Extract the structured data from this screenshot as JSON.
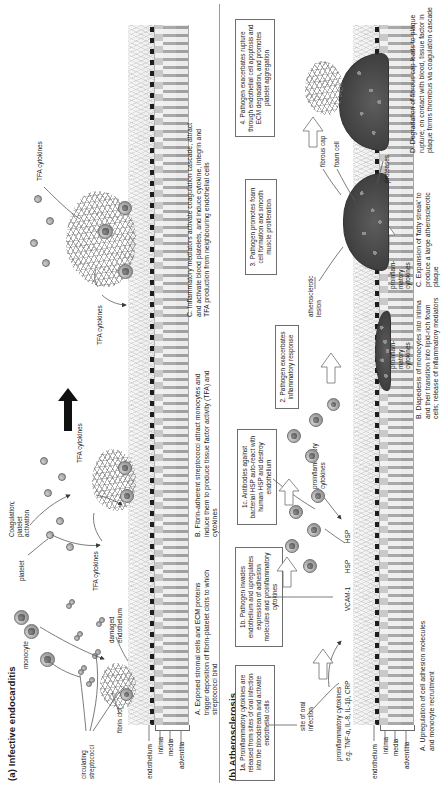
{
  "figure": {
    "panels": [
      {
        "id": "a",
        "title": "(a) Infective endocarditis",
        "labels": {
          "circulating_streptococci": "circulating\nstreptococci",
          "monocyte": "monocyte",
          "fibrin_clot": "fibrin clot",
          "damaged_endothelium": "damaged\nendothelium",
          "platelet": "platelet",
          "coagulation": "Coagulation;\nplatelet\nactivation",
          "tfa_cytokines_1": "TFA cytokines",
          "tfa_cytokines_2": "TFA cytokines",
          "tfa_cytokines_3": "TFA cytokines",
          "tfa_cytokines_4": "TFA cytokines",
          "wall_endothelium": "endothelium",
          "wall_intima": "intima",
          "wall_media": "media",
          "wall_adventitia": "adventitia"
        },
        "captions": [
          "A. Exposed stromal cells and ECM proteins trigger deposition of fibrin-platelet clots to which streptococci bind",
          "B. Fibrin-adherent streptococci attract monocytes and induce them to produce tissue factor activity (TFA) and cytokines",
          "C. Inflammatory mediators activate coagulation cascade, attract and activate blood platelets, and induce cytokine, integrin and TFA production from neighbouring endothelial cells"
        ]
      },
      {
        "id": "b",
        "title": "(b) Atherosclerosis",
        "labels": {
          "site_of_oral_infection": "site of oral\ninfection",
          "proinflammatory_cytokines": "proinflammatory cytokines",
          "cytokine_examples": "e.g. TNF-α, IL-8, IL-1β, CRP",
          "vcam1": "VCAM-1",
          "hsp_1": "HSP",
          "hsp_2": "HSP",
          "proinflammatory_cytokines_2": "proinflammatory\ncytokines",
          "proinflammatory_cytokines_3": "proinflam-\nmatory\ncytokines",
          "proinflammatory_cytokines_4": "proinflam-\nmatory\ncytokines",
          "atherosclerotic_lesion": "atherosclerotic\nlesion",
          "fibrous_cap": "fibrous cap",
          "foam_cell": "foam cell",
          "proteases": "proteases",
          "wall_endothelium": "endothelium",
          "wall_intima": "intima",
          "wall_media": "media",
          "wall_adventitia": "adventitia"
        },
        "boxes": [
          "1a. Proinflammatory cytokines are released from sites of oral infection into the bloodstream and activate endothelial cells",
          "1b. Pathogen invades endothelium and upregulates expression of adhesion molecules and proinflammatory cytokines",
          "1c. Antibodies against bacterial HSP auto-react with human HSP and destroy endothelium",
          "2. Pathogen exacerbates inflammatory response",
          "3. Pathogen promotes foam cell formation and smooth muscle proliferation",
          "4. Pathogen exacerbates rupture through endothelial cell apoptosis and ECM degradation, and promotes platelet aggregation"
        ],
        "captions": [
          "A. Upregulation of cell adhesion molecules and monocyte recruitment",
          "B. Diapedesis of monocytes into intima and their transition into lipid-rich foam cells; release of inflammatory mediators",
          "C. Expansion of 'fatty streak' to produce a large atherosclerotic plaque",
          "D. Degradation of fibrous cap leads to plaque rupture; on contact with blood, tissue factor in plaque forms thrombus via coagulation cascade"
        ]
      }
    ],
    "colors": {
      "ink": "#1a1a1a",
      "line": "#5a5a5a",
      "box_border": "#6e6e6e",
      "plaque": "#3f3f3f",
      "endothelium": "#1d1d1d"
    }
  }
}
